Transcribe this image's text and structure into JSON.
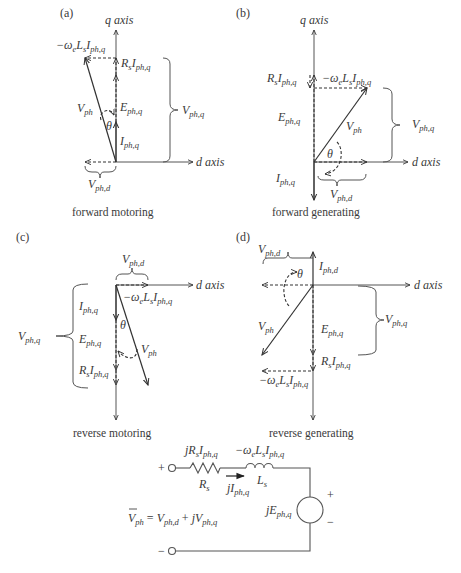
{
  "figure": {
    "panels": [
      {
        "id": "(a)",
        "caption": "forward motoring",
        "q_axis_label": "q axis",
        "d_axis_label": "d axis",
        "labels": {
          "wLsI": "−ωeLsIph,q",
          "RsI": "RsIph,q",
          "E": "Eph,q",
          "I": "Iph,q",
          "Vph": "Vph",
          "theta": "θ",
          "Vphq": "Vph,q",
          "Vphd": "Vph,d"
        }
      },
      {
        "id": "(b)",
        "caption": "forward generating",
        "q_axis_label": "q axis",
        "d_axis_label": "d axis",
        "labels": {
          "wLsI": "−ωeLsIph,q",
          "RsI": "RsIph,q",
          "E": "Eph,q",
          "I": "Iph,q",
          "Vph": "Vph",
          "theta": "θ",
          "Vphq": "Vph,q",
          "Vphd": "Vph,d"
        }
      },
      {
        "id": "(c)",
        "caption": "reverse motoring",
        "d_axis_label": "d axis",
        "labels": {
          "wLsI": "−ωeLsIph,q",
          "RsI": "RsIph,q",
          "E": "Eph,q",
          "I": "Iph,q",
          "Vph": "Vph",
          "theta": "θ",
          "Vphq": "Vph,q",
          "Vphd": "Vph,d"
        }
      },
      {
        "id": "(d)",
        "caption": "reverse generating",
        "d_axis_label": "d axis",
        "labels": {
          "wLsI": "−ωeLsIph,q",
          "RsI": "RsIph,q",
          "E": "Eph,q",
          "I": "Iph,d",
          "Vph": "Vph",
          "theta": "θ",
          "Vphq": "Vph,q",
          "Vphd": "Vph,d"
        }
      }
    ],
    "circuit": {
      "plus_terminal": "+",
      "minus_terminal": "−",
      "resistor_drop": "jRsIph,q",
      "inductor_drop": "−ωeLsIph,q",
      "resistor_label": "Rs",
      "inductor_label": "Ls",
      "current_label": "jIph,q",
      "source_label": "jEph,q",
      "source_plus": "+",
      "source_minus": "−",
      "equation": "V̅ph = Vph,d + jVph,q"
    }
  }
}
